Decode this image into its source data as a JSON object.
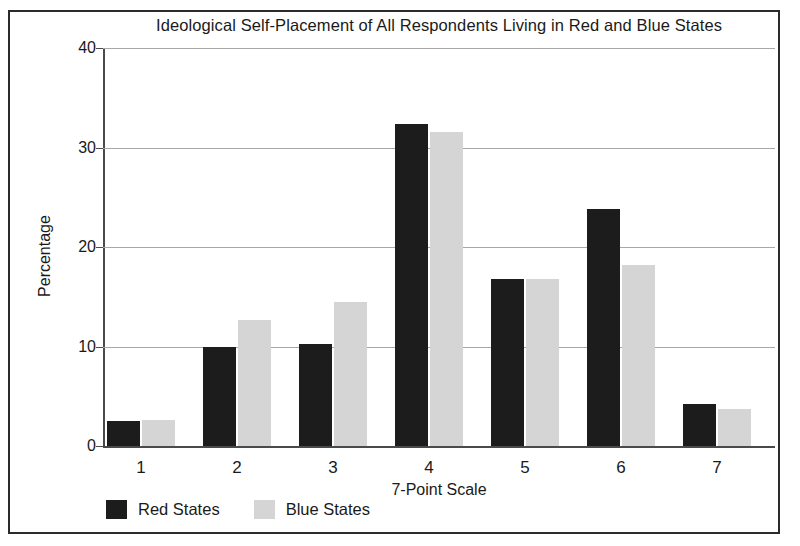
{
  "chart_data": {
    "type": "bar",
    "title": "Ideological Self-Placement of All Respondents Living in Red and Blue States",
    "xlabel": "7-Point Scale",
    "ylabel": "Percentage",
    "categories": [
      "1",
      "2",
      "3",
      "4",
      "5",
      "6",
      "7"
    ],
    "series": [
      {
        "name": "Red States",
        "color": "#1c1c1c",
        "values": [
          2.5,
          10.0,
          10.3,
          32.4,
          16.8,
          23.8,
          4.2
        ]
      },
      {
        "name": "Blue States",
        "color": "#d5d5d5",
        "values": [
          2.6,
          12.7,
          14.5,
          31.6,
          16.8,
          18.2,
          3.7
        ]
      }
    ],
    "ylim": [
      0,
      40
    ],
    "yticks": [
      0,
      10,
      20,
      30,
      40
    ],
    "ytick_labels": [
      "0",
      "10",
      "20",
      "30",
      "40"
    ],
    "grid": true,
    "legend_position": "bottom-left"
  }
}
